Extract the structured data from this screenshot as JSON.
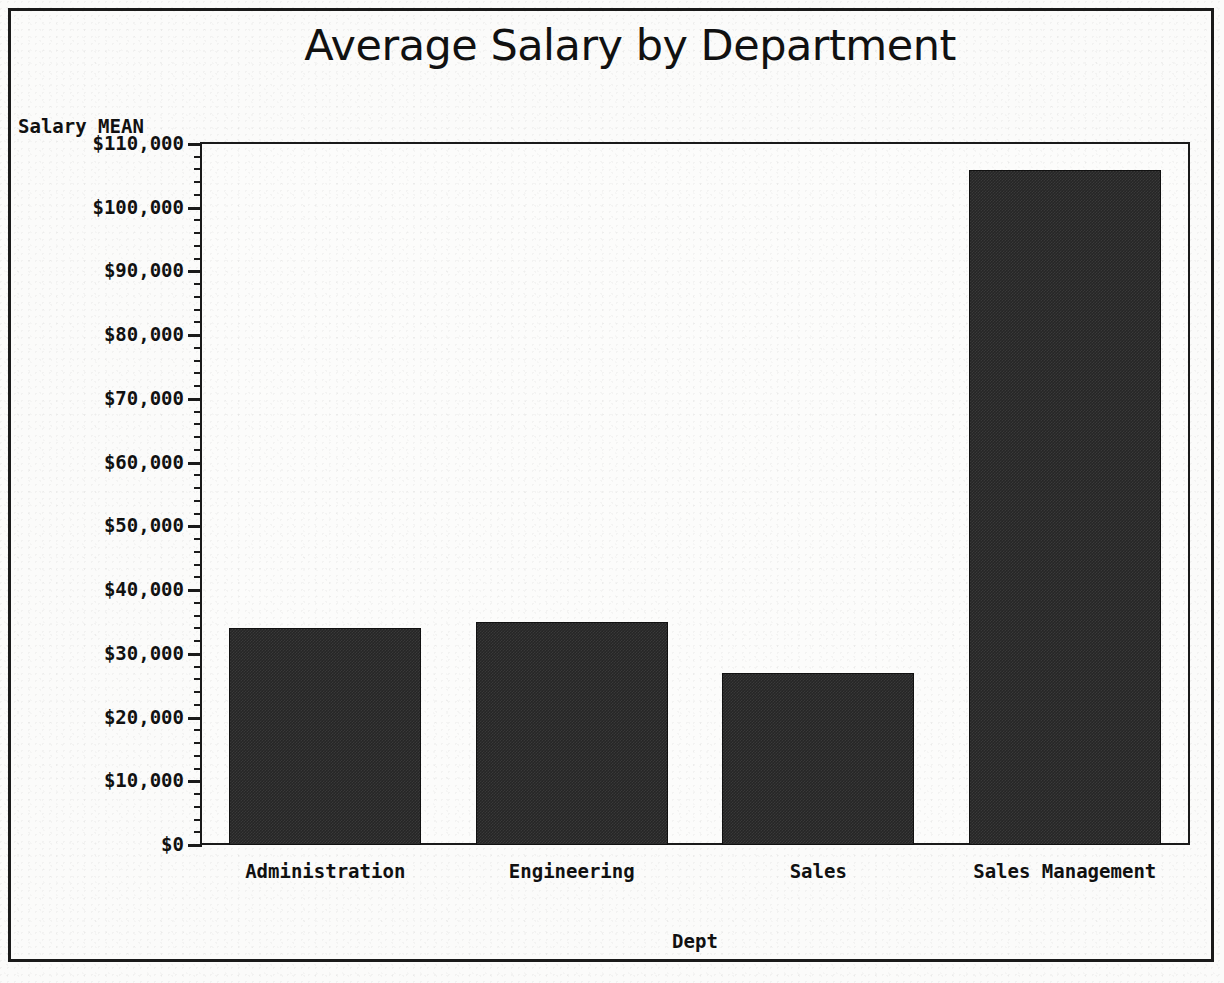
{
  "chart_data": {
    "type": "bar",
    "title": "Average Salary by Department",
    "xlabel": "Dept",
    "ylabel": "Salary MEAN",
    "categories": [
      "Administration",
      "Engineering",
      "Sales",
      "Sales Management"
    ],
    "values": [
      34000,
      35000,
      27000,
      106000
    ],
    "ylim": [
      0,
      110000
    ],
    "ytick_values": [
      0,
      10000,
      20000,
      30000,
      40000,
      50000,
      60000,
      70000,
      80000,
      90000,
      100000,
      110000
    ],
    "ytick_labels": [
      "$0",
      "$10,000",
      "$20,000",
      "$30,000",
      "$40,000",
      "$50,000",
      "$60,000",
      "$70,000",
      "$80,000",
      "$90,000",
      "$100,000",
      "$110,000"
    ],
    "minor_ticks_per_interval": 4,
    "grid": false,
    "legend": null,
    "bar_color": "#262626",
    "frame_color": "#1a1a1a",
    "background_color": "#fbfbfa"
  }
}
